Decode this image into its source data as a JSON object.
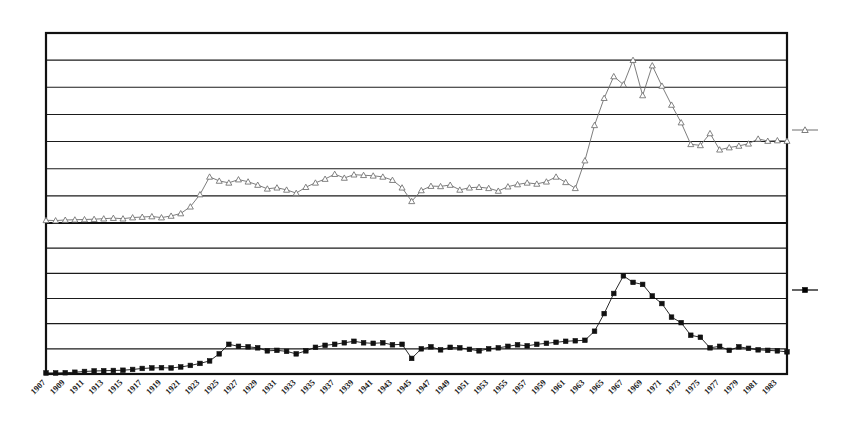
{
  "chart_data": {
    "type": "line",
    "title": "",
    "subtitle": "",
    "xlabel": "",
    "ylabel": "",
    "grid": true,
    "legend_position": "right-outside",
    "panels": [
      {
        "name": "upper-panel",
        "ylim": [
          0,
          7
        ],
        "yticks": [
          0,
          1,
          2,
          3,
          4,
          5,
          6,
          7
        ],
        "ytick_labels": [],
        "gridlines": 7
      },
      {
        "name": "lower-panel",
        "ylim": [
          0,
          6
        ],
        "yticks": [
          0,
          1,
          2,
          3,
          4,
          5,
          6
        ],
        "ytick_labels": [],
        "gridlines": 6
      }
    ],
    "x": [
      1907,
      1908,
      1909,
      1910,
      1911,
      1912,
      1913,
      1914,
      1915,
      1916,
      1917,
      1918,
      1919,
      1920,
      1921,
      1922,
      1923,
      1924,
      1925,
      1926,
      1927,
      1928,
      1929,
      1930,
      1931,
      1932,
      1933,
      1934,
      1935,
      1936,
      1937,
      1938,
      1939,
      1940,
      1941,
      1942,
      1943,
      1944,
      1945,
      1946,
      1947,
      1948,
      1949,
      1950,
      1951,
      1952,
      1953,
      1954,
      1955,
      1956,
      1957,
      1958,
      1959,
      1960,
      1961,
      1962,
      1963,
      1964,
      1965,
      1966,
      1967,
      1968,
      1969,
      1970,
      1971,
      1972,
      1973,
      1974,
      1975,
      1976,
      1977,
      1978,
      1979,
      1980,
      1981,
      1982,
      1983,
      1984
    ],
    "xtick_labels": [
      "1907",
      "1909",
      "1911",
      "1913",
      "1915",
      "1917",
      "1919",
      "1921",
      "1923",
      "1925",
      "1927",
      "1929",
      "1931",
      "1933",
      "1935",
      "1937",
      "1939",
      "1941",
      "1943",
      "1945",
      "1947",
      "1949",
      "1951",
      "1953",
      "1955",
      "1957",
      "1959",
      "1961",
      "1963",
      "1965",
      "1967",
      "1969",
      "1971",
      "1973",
      "1975",
      "1977",
      "1979",
      "1981",
      "1983"
    ],
    "xtick_rotation_deg": 45,
    "series": [
      {
        "name": "series-upper-triangle",
        "panel": "upper-panel",
        "marker": "open-triangle",
        "color": "#6e6e6e",
        "fill": "#ffffff",
        "values": [
          0.1,
          0.09,
          0.11,
          0.12,
          0.13,
          0.14,
          0.16,
          0.18,
          0.16,
          0.2,
          0.22,
          0.24,
          0.2,
          0.26,
          0.35,
          0.6,
          1.05,
          1.7,
          1.55,
          1.48,
          1.6,
          1.52,
          1.4,
          1.26,
          1.3,
          1.22,
          1.1,
          1.32,
          1.48,
          1.62,
          1.8,
          1.66,
          1.78,
          1.76,
          1.74,
          1.7,
          1.58,
          1.3,
          0.8,
          1.2,
          1.36,
          1.35,
          1.4,
          1.22,
          1.3,
          1.32,
          1.28,
          1.18,
          1.34,
          1.42,
          1.48,
          1.44,
          1.52,
          1.7,
          1.5,
          1.28,
          2.3,
          3.6,
          4.6,
          5.4,
          5.1,
          6.0,
          4.7,
          5.8,
          5.05,
          4.35,
          3.7,
          2.9,
          2.86,
          3.3,
          2.7,
          2.78,
          2.84,
          2.92,
          3.1,
          3.02,
          3.04,
          3.02
        ]
      },
      {
        "name": "series-lower-square",
        "panel": "lower-panel",
        "marker": "filled-square",
        "color": "#111111",
        "fill": "#111111",
        "values": [
          0.04,
          0.04,
          0.05,
          0.07,
          0.1,
          0.12,
          0.13,
          0.14,
          0.15,
          0.18,
          0.22,
          0.24,
          0.25,
          0.24,
          0.28,
          0.34,
          0.42,
          0.52,
          0.8,
          1.18,
          1.1,
          1.08,
          1.04,
          0.92,
          0.94,
          0.9,
          0.8,
          0.92,
          1.06,
          1.14,
          1.18,
          1.24,
          1.3,
          1.24,
          1.22,
          1.24,
          1.16,
          1.18,
          0.62,
          1.0,
          1.08,
          0.96,
          1.06,
          1.04,
          0.98,
          0.92,
          1.0,
          1.04,
          1.1,
          1.16,
          1.12,
          1.18,
          1.22,
          1.26,
          1.3,
          1.32,
          1.34,
          1.7,
          2.4,
          3.2,
          3.9,
          3.64,
          3.56,
          3.1,
          2.8,
          2.26,
          2.04,
          1.54,
          1.46,
          1.04,
          1.1,
          0.94,
          1.08,
          1.02,
          0.96,
          0.94,
          0.92,
          0.88
        ]
      }
    ],
    "legend": [
      {
        "name": "legend-marker-upper",
        "marker": "open-triangle",
        "color": "#6e6e6e",
        "label": ""
      },
      {
        "name": "legend-marker-lower",
        "marker": "filled-square",
        "color": "#111111",
        "label": ""
      }
    ]
  }
}
